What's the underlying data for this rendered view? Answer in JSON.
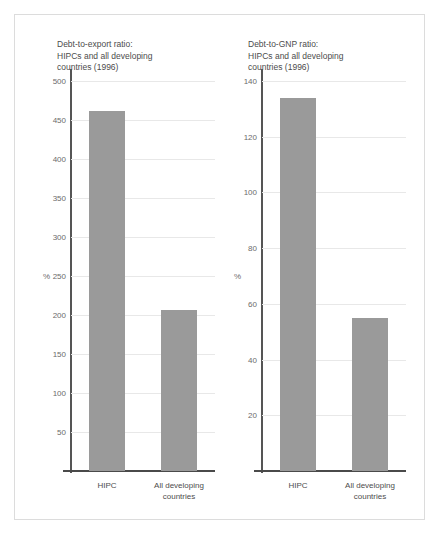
{
  "figure": {
    "background": "#ffffff",
    "frame_color": "#dcdcdc",
    "bar_color": "#9a9a9a",
    "gridline_color": "#e8e8e8",
    "axis_color": "#4a4a4a"
  },
  "chart_data": [
    {
      "type": "bar",
      "title": "Debt-to-export ratio:\nHIPCs and all developing\ncountries (1996)",
      "xlabel": "",
      "ylabel": "%",
      "categories": [
        "HIPC",
        "All developing\ncountries"
      ],
      "values": [
        462,
        207
      ],
      "ylim": [
        0,
        500
      ],
      "yticks": [
        50,
        100,
        150,
        200,
        250,
        300,
        350,
        400,
        450,
        500
      ],
      "ytick_labels": [
        "50",
        "100",
        "150",
        "200",
        "250",
        "300",
        "350",
        "400",
        "450",
        "500"
      ],
      "grid": true,
      "legend": "none"
    },
    {
      "type": "bar",
      "title": "Debt-to-GNP ratio:\nHIPCs and all developing\ncountries (1996)",
      "xlabel": "",
      "ylabel": "%",
      "categories": [
        "HIPC",
        "All developing\ncountries"
      ],
      "values": [
        134,
        55
      ],
      "ylim": [
        0,
        140
      ],
      "yticks": [
        20,
        40,
        60,
        80,
        100,
        120,
        140
      ],
      "ytick_labels": [
        "20",
        "40",
        "60",
        "80",
        "100",
        "120",
        "140"
      ],
      "grid": true,
      "legend": "none"
    }
  ]
}
